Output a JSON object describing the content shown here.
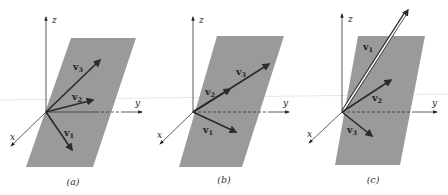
{
  "figure": {
    "axis_labels": {
      "x": "x",
      "y": "y",
      "z": "z"
    },
    "vector_prefix": "v",
    "colors": {
      "plane": "#9a9a9a",
      "vector": "#2b2b2b",
      "axis": "#333333",
      "background": "#ffffff",
      "highlight": "#ffffff"
    },
    "panels": [
      {
        "caption": "(a)",
        "vectors": [
          {
            "name": "v",
            "sub": "1",
            "note": "in plane, pointing down-right"
          },
          {
            "name": "v",
            "sub": "2",
            "note": "in plane"
          },
          {
            "name": "v",
            "sub": "3",
            "note": "in plane"
          }
        ]
      },
      {
        "caption": "(b)",
        "vectors": [
          {
            "name": "v",
            "sub": "1",
            "note": "in plane"
          },
          {
            "name": "v",
            "sub": "2",
            "note": "collinear with v3, shorter"
          },
          {
            "name": "v",
            "sub": "3",
            "note": "collinear with v2"
          }
        ]
      },
      {
        "caption": "(c)",
        "vectors": [
          {
            "name": "v",
            "sub": "1",
            "note": "out of plane, long, outlined"
          },
          {
            "name": "v",
            "sub": "2",
            "note": "in plane"
          },
          {
            "name": "v",
            "sub": "3",
            "note": "in plane"
          }
        ]
      }
    ]
  }
}
